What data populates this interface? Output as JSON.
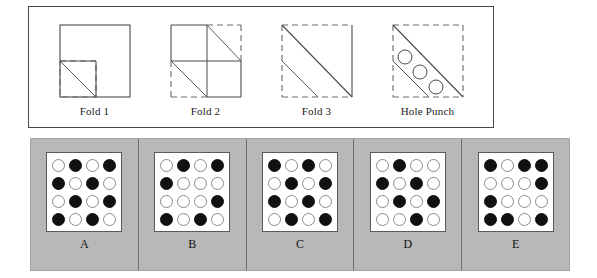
{
  "fold_sequence": {
    "steps": [
      {
        "id": "fold-1",
        "caption": "Fold 1",
        "figure": "square-with-lower-left-quadrant-folded",
        "outline": "solid-square",
        "dashed_region": "lower-left-quadrant",
        "creases": [
          "diagonal-lower-left-quadrant"
        ]
      },
      {
        "id": "fold-2",
        "caption": "Fold 2",
        "figure": "square-with-left-half-and-upper-right-folded",
        "outline": "solid-lower-left-and-right",
        "dashed_region": "left-column-and-upper-right",
        "creases": [
          "vertical-midline",
          "horizontal-midline",
          "diagonal-upper-right",
          "diagonal-lower-left"
        ]
      },
      {
        "id": "fold-3",
        "caption": "Fold 3",
        "figure": "triangle-after-diagonal-fold",
        "outline": "dashed-square",
        "dashed_region": "upper-left-triangle",
        "creases": [
          "main-diagonal",
          "lower-left-parallel-diagonal"
        ]
      },
      {
        "id": "hole-punch",
        "caption": "Hole Punch",
        "figure": "triangle-with-three-punched-holes",
        "outline": "dashed-square",
        "creases": [
          "main-diagonal",
          "lower-left-parallel-diagonal"
        ],
        "holes": [
          {
            "cx": 18,
            "cy": 36,
            "r": 7
          },
          {
            "cx": 33,
            "cy": 51,
            "r": 7
          },
          {
            "cx": 49,
            "cy": 66,
            "r": 7
          }
        ]
      }
    ]
  },
  "answers": {
    "grid_rows": 4,
    "grid_cols": 4,
    "options": [
      {
        "label": "A",
        "pattern": [
          [
            "open",
            "filled",
            "open",
            "filled"
          ],
          [
            "filled",
            "open",
            "filled",
            "open"
          ],
          [
            "open",
            "filled",
            "open",
            "filled"
          ],
          [
            "filled",
            "open",
            "filled",
            "open"
          ]
        ]
      },
      {
        "label": "B",
        "pattern": [
          [
            "open",
            "filled",
            "open",
            "filled"
          ],
          [
            "filled",
            "open",
            "open",
            "open"
          ],
          [
            "open",
            "open",
            "open",
            "filled"
          ],
          [
            "filled",
            "open",
            "filled",
            "open"
          ]
        ]
      },
      {
        "label": "C",
        "pattern": [
          [
            "filled",
            "open",
            "filled",
            "open"
          ],
          [
            "open",
            "filled",
            "open",
            "filled"
          ],
          [
            "filled",
            "open",
            "filled",
            "open"
          ],
          [
            "open",
            "filled",
            "open",
            "filled"
          ]
        ]
      },
      {
        "label": "D",
        "pattern": [
          [
            "open",
            "filled",
            "open",
            "open"
          ],
          [
            "filled",
            "open",
            "filled",
            "open"
          ],
          [
            "open",
            "filled",
            "open",
            "filled"
          ],
          [
            "open",
            "open",
            "filled",
            "open"
          ]
        ]
      },
      {
        "label": "E",
        "pattern": [
          [
            "filled",
            "open",
            "filled",
            "filled"
          ],
          [
            "open",
            "open",
            "open",
            "filled"
          ],
          [
            "filled",
            "open",
            "open",
            "open"
          ],
          [
            "filled",
            "filled",
            "open",
            "filled"
          ]
        ]
      }
    ]
  },
  "colors": {
    "panel_background": "#b8b8b8",
    "card_background": "#ffffff",
    "filled_dot": "#111111",
    "open_dot_border": "#8a8a8a",
    "line": "#4a4a4a"
  }
}
